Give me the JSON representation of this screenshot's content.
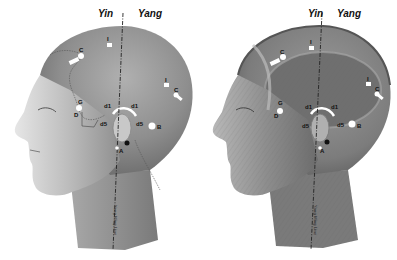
{
  "figure": {
    "panels": [
      {
        "id": "skin",
        "yin_label": "Yin",
        "yang_label": "Yang",
        "meridian_caption": "Yang Ming Line",
        "points": {
          "I_top": "I",
          "C_front": "C",
          "I_back": "I",
          "C_back": "C",
          "G": "G",
          "D": "D",
          "d1_front": "d1",
          "d1_back": "d1",
          "d5_front": "d5",
          "d5_back": "d5",
          "B": "B",
          "A": "A"
        }
      },
      {
        "id": "muscle",
        "yin_label": "Yin",
        "yang_label": "Yang",
        "meridian_caption": "Yang Ming Line",
        "points": {
          "I_top": "I",
          "C_front": "C",
          "I_back": "I",
          "C_back": "C",
          "G": "G",
          "D": "D",
          "d1_front": "d1",
          "d1_back": "d1",
          "d5_front": "d5",
          "d5_back": "d5",
          "B": "B",
          "A": "A"
        }
      }
    ],
    "colors": {
      "skin_dark": "#6e6e6e",
      "skin_mid": "#9a9a9a",
      "skin_light": "#cfcfcf",
      "muscle_dark": "#5e5e5e",
      "muscle_mid": "#8c8c8c",
      "point_white": "#ffffff",
      "line": "#222222"
    }
  }
}
